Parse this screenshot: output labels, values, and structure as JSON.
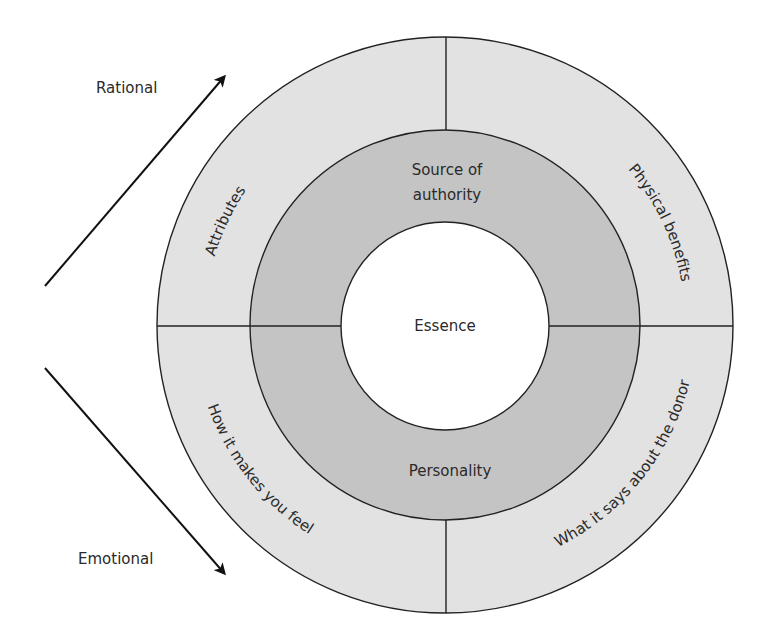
{
  "diagram": {
    "type": "concentric-ring-model",
    "center": {
      "label": "Essence"
    },
    "middle_ring": {
      "top_label_line1": "Source of",
      "top_label_line2": "authority",
      "bottom_label": "Personality"
    },
    "outer_ring": {
      "quadrants": [
        {
          "position": "top-left",
          "label": "Attributes"
        },
        {
          "position": "top-right",
          "label": "Physical benefits"
        },
        {
          "position": "bottom-left",
          "label": "How it makes you feel"
        },
        {
          "position": "bottom-right",
          "label": "What it says about the donor"
        }
      ]
    },
    "axis": {
      "rational_label": "Rational",
      "emotional_label": "Emotional"
    },
    "colors": {
      "outer_ring": "#e2e2e2",
      "middle_ring": "#c4c4c4",
      "center": "#ffffff",
      "stroke": "#222222",
      "text": "#2a2a2a"
    }
  }
}
